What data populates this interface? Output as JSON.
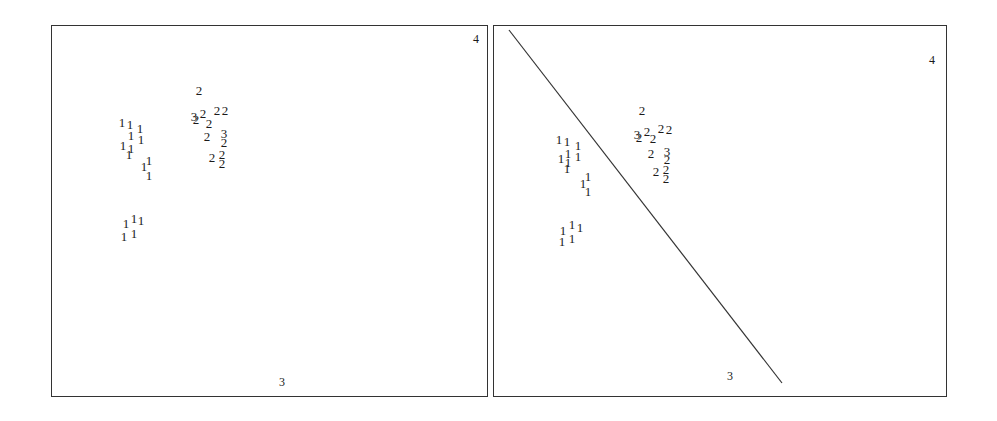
{
  "chart_data": [
    {
      "type": "scatter",
      "title": "",
      "panel": "left",
      "xlabel": "",
      "ylabel": "",
      "grid": false,
      "corner_labels": [
        {
          "text": "4",
          "x": 476,
          "y": 43
        },
        {
          "text": "3",
          "x": 282,
          "y": 386
        }
      ],
      "marker_style": "class-number glyphs",
      "series": [
        {
          "name": "1",
          "points": [
            [
              122,
              127
            ],
            [
              130,
              129
            ],
            [
              131,
              140
            ],
            [
              140,
              133
            ],
            [
              141,
              144
            ],
            [
              123,
              150
            ],
            [
              131,
              153
            ],
            [
              129,
              159
            ],
            [
              144,
              171
            ],
            [
              149,
              165
            ],
            [
              149,
              180
            ],
            [
              126,
              228
            ],
            [
              134,
              223
            ],
            [
              141,
              225
            ],
            [
              124,
              241
            ],
            [
              134,
              238
            ]
          ]
        },
        {
          "name": "2",
          "points": [
            [
              199,
              95
            ],
            [
              203,
              118
            ],
            [
              209,
              128
            ],
            [
              217,
              115
            ],
            [
              225,
              115
            ],
            [
              196,
              124
            ],
            [
              207,
              141
            ],
            [
              224,
              147
            ],
            [
              212,
              162
            ],
            [
              222,
              159
            ],
            [
              222,
              168
            ]
          ]
        },
        {
          "name": "3",
          "points": [
            [
              194,
              121
            ],
            [
              224,
              138
            ]
          ]
        }
      ],
      "separator_line": null
    },
    {
      "type": "scatter",
      "title": "",
      "panel": "right",
      "xlabel": "",
      "ylabel": "",
      "grid": false,
      "corner_labels": [
        {
          "text": "4",
          "x": 932,
          "y": 64
        },
        {
          "text": "3",
          "x": 730,
          "y": 380
        }
      ],
      "marker_style": "class-number glyphs",
      "series": [
        {
          "name": "1",
          "points": [
            [
              559,
              144
            ],
            [
              567,
              146
            ],
            [
              568,
              158
            ],
            [
              578,
              150
            ],
            [
              578,
              161
            ],
            [
              561,
              163
            ],
            [
              568,
              167
            ],
            [
              567,
              173
            ],
            [
              583,
              188
            ],
            [
              588,
              181
            ],
            [
              588,
              196
            ],
            [
              563,
              235
            ],
            [
              572,
              229
            ],
            [
              580,
              232
            ],
            [
              562,
              246
            ],
            [
              572,
              243
            ]
          ]
        },
        {
          "name": "2",
          "points": [
            [
              642,
              115
            ],
            [
              647,
              136
            ],
            [
              653,
              143
            ],
            [
              661,
              133
            ],
            [
              669,
              134
            ],
            [
              639,
              142
            ],
            [
              651,
              158
            ],
            [
              667,
              164
            ],
            [
              656,
              176
            ],
            [
              666,
              174
            ],
            [
              666,
              183
            ]
          ]
        },
        {
          "name": "3",
          "points": [
            [
              637,
              139
            ],
            [
              667,
              156
            ]
          ]
        }
      ],
      "separator_line": {
        "x1": 509,
        "y1": 30,
        "x2": 782,
        "y2": 383
      }
    }
  ]
}
